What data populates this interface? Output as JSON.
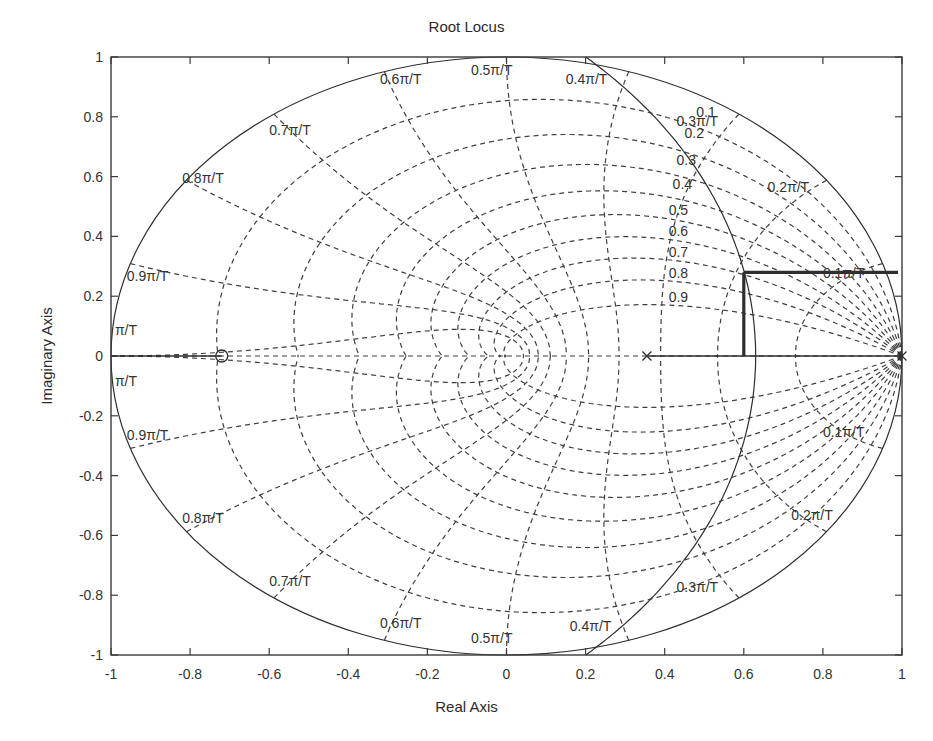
{
  "chart_data": {
    "type": "line",
    "subtype": "root-locus (discrete z-plane with zgrid)",
    "title": "Root Locus",
    "xlabel": "Real Axis",
    "ylabel": "Imaginary Axis",
    "xlim": [
      -1,
      1
    ],
    "ylim": [
      -1,
      1
    ],
    "xticks": [
      -1,
      -0.8,
      -0.6,
      -0.4,
      -0.2,
      0,
      0.2,
      0.4,
      0.6,
      0.8,
      1
    ],
    "xtick_labels": [
      "-1",
      "-0.8",
      "-0.6",
      "-0.4",
      "-0.2",
      "0",
      "0.2",
      "0.4",
      "0.6",
      "0.8",
      "1"
    ],
    "yticks": [
      1,
      0.8,
      0.6,
      0.4,
      0.2,
      0,
      -0.2,
      -0.4,
      -0.6,
      -0.8,
      -1
    ],
    "ytick_labels": [
      "1",
      "0.8",
      "0.6",
      "0.4",
      "0.2",
      "0",
      "-0.2",
      "-0.4",
      "-0.6",
      "-0.8",
      "-1"
    ],
    "grid": "zgrid (dashed)",
    "damping_ratios": [
      0.1,
      0.2,
      0.3,
      0.4,
      0.5,
      0.6,
      0.7,
      0.8,
      0.9
    ],
    "damping_labels": [
      {
        "text": "0.1",
        "x": 0.48,
        "y": 0.8
      },
      {
        "text": "0.2",
        "x": 0.45,
        "y": 0.73
      },
      {
        "text": "0.3",
        "x": 0.43,
        "y": 0.64
      },
      {
        "text": "0.4",
        "x": 0.42,
        "y": 0.56
      },
      {
        "text": "0.5",
        "x": 0.41,
        "y": 0.47
      },
      {
        "text": "0.6",
        "x": 0.41,
        "y": 0.4
      },
      {
        "text": "0.7",
        "x": 0.41,
        "y": 0.33
      },
      {
        "text": "0.8",
        "x": 0.41,
        "y": 0.26
      },
      {
        "text": "0.9",
        "x": 0.41,
        "y": 0.18
      }
    ],
    "natural_frequencies": [
      "0.1π/T",
      "0.2π/T",
      "0.3π/T",
      "0.4π/T",
      "0.5π/T",
      "0.6π/T",
      "0.7π/T",
      "0.8π/T",
      "0.9π/T",
      "π/T"
    ],
    "frequency_labels": [
      {
        "text": "0.6π/T",
        "x": -0.32,
        "y": 0.91
      },
      {
        "text": "0.5π/T",
        "x": -0.09,
        "y": 0.94
      },
      {
        "text": "0.4π/T",
        "x": 0.15,
        "y": 0.91
      },
      {
        "text": "0.3π/T",
        "x": 0.43,
        "y": 0.77
      },
      {
        "text": "0.7π/T",
        "x": -0.6,
        "y": 0.74
      },
      {
        "text": "0.2π/T",
        "x": 0.66,
        "y": 0.55
      },
      {
        "text": "0.8π/T",
        "x": -0.82,
        "y": 0.58
      },
      {
        "text": "0.1π/T",
        "x": 0.8,
        "y": 0.26
      },
      {
        "text": "0.9π/T",
        "x": -0.96,
        "y": 0.25
      },
      {
        "text": "π/T",
        "x": -0.99,
        "y": 0.07
      },
      {
        "text": "π/T",
        "x": -0.99,
        "y": -0.1
      },
      {
        "text": "0.9π/T",
        "x": -0.96,
        "y": -0.28
      },
      {
        "text": "0.1π/T",
        "x": 0.8,
        "y": -0.27
      },
      {
        "text": "0.8π/T",
        "x": -0.82,
        "y": -0.56
      },
      {
        "text": "0.2π/T",
        "x": 0.72,
        "y": -0.55
      },
      {
        "text": "0.7π/T",
        "x": -0.6,
        "y": -0.77
      },
      {
        "text": "0.3π/T",
        "x": 0.43,
        "y": -0.79
      },
      {
        "text": "0.6π/T",
        "x": -0.32,
        "y": -0.91
      },
      {
        "text": "0.5π/T",
        "x": -0.09,
        "y": -0.96
      },
      {
        "text": "0.4π/T",
        "x": 0.16,
        "y": -0.92
      }
    ],
    "unit_circle": {
      "cx": 0,
      "cy": 0,
      "r": 1
    },
    "locus_circle": {
      "cx": -0.748,
      "cy": 0,
      "r": 1.378
    },
    "locus_segments": [
      {
        "name": "real-axis-left",
        "points": [
          [
            -1,
            0
          ],
          [
            -0.72,
            0
          ]
        ],
        "weight": "thin"
      },
      {
        "name": "real-axis-right",
        "points": [
          [
            0.355,
            0
          ],
          [
            1,
            0
          ]
        ],
        "weight": "thin"
      },
      {
        "name": "thick-vertical",
        "points": [
          [
            0.6,
            0.0
          ],
          [
            0.6,
            0.28
          ]
        ],
        "weight": "thick"
      },
      {
        "name": "thick-horizontal",
        "points": [
          [
            0.6,
            0.28
          ],
          [
            0.99,
            0.28
          ]
        ],
        "weight": "thick"
      }
    ],
    "poles": [
      {
        "x": 0.355,
        "y": 0
      },
      {
        "x": 1.0,
        "y": 0
      }
    ],
    "zeros": [
      {
        "x": -0.72,
        "y": 0
      }
    ],
    "colors": {
      "axes": "#3a3a3a",
      "grid": "#3f3f3f",
      "locus": "#2e2e2e",
      "text": "#333333",
      "background": "#ffffff"
    }
  }
}
